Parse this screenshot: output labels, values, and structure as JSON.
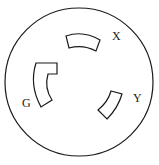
{
  "diagram": {
    "type": "locking-receptacle-face",
    "colors": {
      "stroke": "#1a1a1a",
      "background": "#ffffff"
    },
    "slots": [
      {
        "id": "X",
        "label": "X"
      },
      {
        "id": "G",
        "label": "G"
      },
      {
        "id": "Y",
        "label": "Y"
      }
    ]
  }
}
